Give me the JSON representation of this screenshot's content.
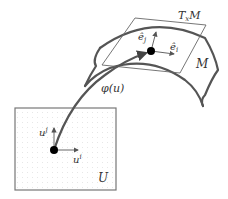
{
  "diagram": {
    "labels": {
      "tangent_space": "T",
      "tangent_space_sub": "x",
      "tangent_space_tail": "M",
      "manifold": "M",
      "domain": "U",
      "map": "φ(u)",
      "basis_i_hat": "ê",
      "basis_i_sub": "i",
      "basis_j_hat": "ê",
      "basis_j_sub": "j",
      "coord_i": "u",
      "coord_i_sup": "i",
      "coord_j": "u",
      "coord_j_sup": "j"
    },
    "colors": {
      "stroke": "#555555",
      "thin": "#666666",
      "point": "#000000",
      "grid": "#e6e6e6"
    }
  }
}
